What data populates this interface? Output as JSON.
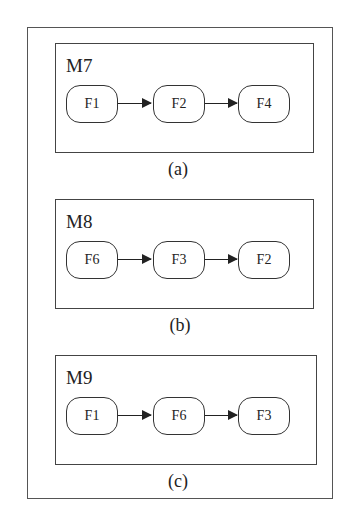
{
  "diagram": {
    "panels": [
      {
        "id": "a",
        "title": "M7",
        "caption": "(a)",
        "nodes": [
          "F1",
          "F2",
          "F4"
        ]
      },
      {
        "id": "b",
        "title": "M8",
        "caption": "(b)",
        "nodes": [
          "F6",
          "F3",
          "F2"
        ]
      },
      {
        "id": "c",
        "title": "M9",
        "caption": "(c)",
        "nodes": [
          "F1",
          "F6",
          "F3"
        ]
      }
    ],
    "edges": [
      {
        "panel": "a",
        "from": "F1",
        "to": "F2"
      },
      {
        "panel": "a",
        "from": "F2",
        "to": "F4"
      },
      {
        "panel": "b",
        "from": "F6",
        "to": "F3"
      },
      {
        "panel": "b",
        "from": "F3",
        "to": "F2"
      },
      {
        "panel": "c",
        "from": "F1",
        "to": "F6"
      },
      {
        "panel": "c",
        "from": "F6",
        "to": "F3"
      }
    ]
  }
}
